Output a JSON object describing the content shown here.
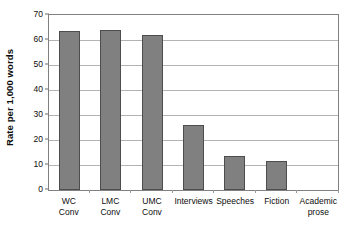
{
  "chart_data": {
    "type": "bar",
    "title": "",
    "xlabel": "",
    "ylabel": "Rate per 1,000 words",
    "ylim": [
      0,
      70
    ],
    "ytick_labels": [
      "70",
      "60",
      "50",
      "40",
      "30",
      "20",
      "10",
      "0"
    ],
    "ytick_values": [
      70,
      60,
      50,
      40,
      30,
      20,
      10,
      0
    ],
    "grid": true,
    "legend": "none",
    "bar_color": "#808080",
    "bar_edge_color": "#4d4d4d",
    "gridline_color": "#b3b3b3",
    "plot_border_color": "#808080",
    "categories": [
      "WC Conv",
      "LMC Conv",
      "UMC Conv",
      "Interviews",
      "Speeches",
      "Fiction",
      "Academic prose"
    ],
    "category_lines": [
      [
        "WC",
        "Conv"
      ],
      [
        "LMC",
        "Conv"
      ],
      [
        "UMC",
        "Conv"
      ],
      [
        "Interviews"
      ],
      [
        "Speeches"
      ],
      [
        "Fiction"
      ],
      [
        "Academic",
        "prose"
      ]
    ],
    "values": [
      63.5,
      64,
      62,
      26,
      13.5,
      11.5,
      0
    ]
  }
}
